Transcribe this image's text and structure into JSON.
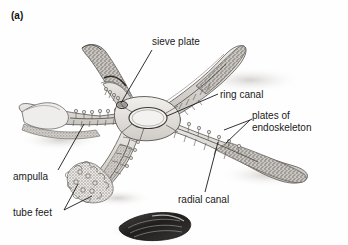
{
  "figure": {
    "panel_label": "(a)",
    "background_color": "#ffffff",
    "ink_color": "#1a1a1a",
    "style": "grayscale pencil / halftone scientific illustration"
  },
  "labels": {
    "sieve_plate": "sieve plate",
    "ring_canal": "ring canal",
    "plates_line1": "plates of",
    "plates_line2": "endoskeleton",
    "ampulla": "ampulla",
    "tube_feet": "tube feet",
    "radial_canal": "radial canal"
  },
  "illustration_parts": {
    "starfish": "five-armed sea star, arms cut away to reveal internal canals",
    "central_disc": "central disc with oval ring canal",
    "arms": 5,
    "prey": "dark mussel shell at lower centre",
    "tube_feet_cluster": "bushy cluster of tube feet at lower left arm tip",
    "cut_arm": "left arm shown sectioned / broken away"
  },
  "colors": {
    "paper": "#ffffff",
    "line": "#1a1a1a",
    "body_light": "#e9e7e4",
    "body_mid": "#bdb9b4",
    "body_dark": "#8d8883",
    "texture_dark": "#6e6a66",
    "shadow": "#d8d6d3",
    "mussel_dark": "#2a2927",
    "mussel_mid": "#585653"
  }
}
